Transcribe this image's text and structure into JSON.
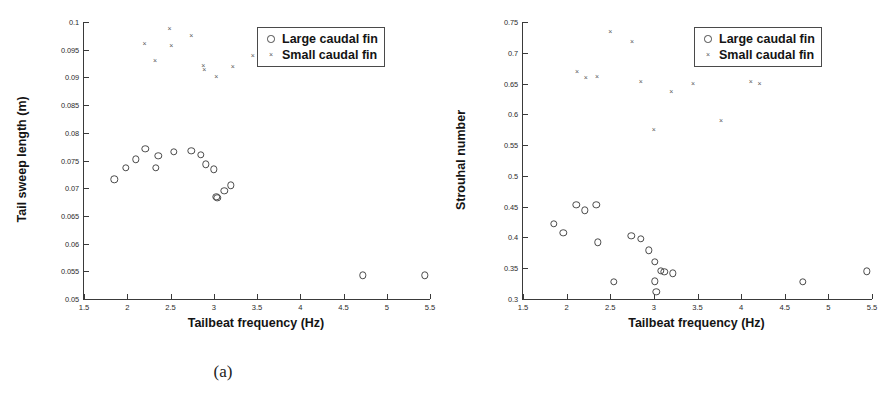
{
  "figure": {
    "legend_labels": {
      "large": "Large caudal fin",
      "small": "Small caudal fin"
    },
    "caption_a": "(a)",
    "caption_b": "(b)"
  },
  "chart_data": [
    {
      "panel": "a",
      "caption": "(a)",
      "type": "scatter",
      "title": "",
      "xlabel": "Tailbeat frequency (Hz)",
      "ylabel": "Tail sweep length (m)",
      "xlim": [
        1.5,
        5.5
      ],
      "ylim": [
        0.05,
        0.1
      ],
      "xticks": [
        1.5,
        2,
        2.5,
        3,
        3.5,
        4,
        4.5,
        5,
        5.5
      ],
      "xticklabels": [
        "1.5",
        "2",
        "2.5",
        "3",
        "3.5",
        "4",
        "4.5",
        "5",
        "5.5"
      ],
      "yticks": [
        0.05,
        0.055,
        0.06,
        0.065,
        0.07,
        0.075,
        0.08,
        0.085,
        0.09,
        0.095,
        0.1
      ],
      "yticklabels": [
        "0.05",
        "0.055",
        "0.06",
        "0.065",
        "0.07",
        "0.075",
        "0.08",
        "0.085",
        "0.09",
        "0.095",
        "0.1"
      ],
      "grid": false,
      "legend_position": "upper right",
      "series": [
        {
          "name": "Large caudal fin",
          "marker": "circle",
          "points": [
            [
              1.85,
              0.0716
            ],
            [
              1.98,
              0.0737
            ],
            [
              2.1,
              0.0752
            ],
            [
              2.21,
              0.0771
            ],
            [
              2.33,
              0.0737
            ],
            [
              2.36,
              0.0758
            ],
            [
              2.54,
              0.0766
            ],
            [
              2.74,
              0.0768
            ],
            [
              2.85,
              0.076
            ],
            [
              2.91,
              0.0743
            ],
            [
              3.0,
              0.0734
            ],
            [
              3.03,
              0.0684
            ],
            [
              3.04,
              0.0683
            ],
            [
              3.12,
              0.0695
            ],
            [
              3.2,
              0.0705
            ],
            [
              4.72,
              0.0543
            ],
            [
              5.44,
              0.0543
            ]
          ]
        },
        {
          "name": "Small caudal fin",
          "marker": "cross",
          "points": [
            [
              2.2,
              0.0961
            ],
            [
              2.32,
              0.093
            ],
            [
              2.49,
              0.0988
            ],
            [
              2.51,
              0.0956
            ],
            [
              2.74,
              0.0974
            ],
            [
              2.88,
              0.0921
            ],
            [
              2.89,
              0.0913
            ],
            [
              3.03,
              0.09
            ],
            [
              3.22,
              0.0918
            ],
            [
              3.45,
              0.0938
            ]
          ]
        }
      ]
    },
    {
      "panel": "b",
      "caption": "(b)",
      "type": "scatter",
      "title": "",
      "xlabel": "Tailbeat frequency (Hz)",
      "ylabel": "Strouhal number",
      "xlim": [
        1.5,
        5.5
      ],
      "ylim": [
        0.3,
        0.75
      ],
      "xticks": [
        1.5,
        2,
        2.5,
        3,
        3.5,
        4,
        4.5,
        5,
        5.5
      ],
      "xticklabels": [
        "1.5",
        "2",
        "2.5",
        "3",
        "3.5",
        "4",
        "4.5",
        "5",
        "5.5"
      ],
      "yticks": [
        0.3,
        0.35,
        0.4,
        0.45,
        0.5,
        0.55,
        0.6,
        0.65,
        0.7,
        0.75
      ],
      "yticklabels": [
        "0.3",
        "0.35",
        "0.4",
        "0.45",
        "0.5",
        "0.55",
        "0.6",
        "0.65",
        "0.7",
        "0.75"
      ],
      "grid": false,
      "legend_position": "upper right",
      "series": [
        {
          "name": "Large caudal fin",
          "marker": "circle",
          "points": [
            [
              1.85,
              0.422
            ],
            [
              1.96,
              0.408
            ],
            [
              2.11,
              0.453
            ],
            [
              2.21,
              0.444
            ],
            [
              2.34,
              0.453
            ],
            [
              2.36,
              0.392
            ],
            [
              2.54,
              0.328
            ],
            [
              2.74,
              0.403
            ],
            [
              2.85,
              0.398
            ],
            [
              2.94,
              0.379
            ],
            [
              3.01,
              0.36
            ],
            [
              3.01,
              0.329
            ],
            [
              3.03,
              0.312
            ],
            [
              3.08,
              0.346
            ],
            [
              3.12,
              0.344
            ],
            [
              3.22,
              0.342
            ],
            [
              4.71,
              0.328
            ],
            [
              5.44,
              0.345
            ]
          ]
        },
        {
          "name": "Small caudal fin",
          "marker": "cross",
          "points": [
            [
              2.12,
              0.668
            ],
            [
              2.22,
              0.659
            ],
            [
              2.35,
              0.661
            ],
            [
              2.5,
              0.733
            ],
            [
              2.75,
              0.717
            ],
            [
              2.85,
              0.653
            ],
            [
              3.0,
              0.575
            ],
            [
              3.2,
              0.637
            ],
            [
              3.45,
              0.65
            ],
            [
              3.77,
              0.589
            ],
            [
              4.11,
              0.653
            ],
            [
              4.21,
              0.65
            ]
          ]
        }
      ]
    }
  ]
}
